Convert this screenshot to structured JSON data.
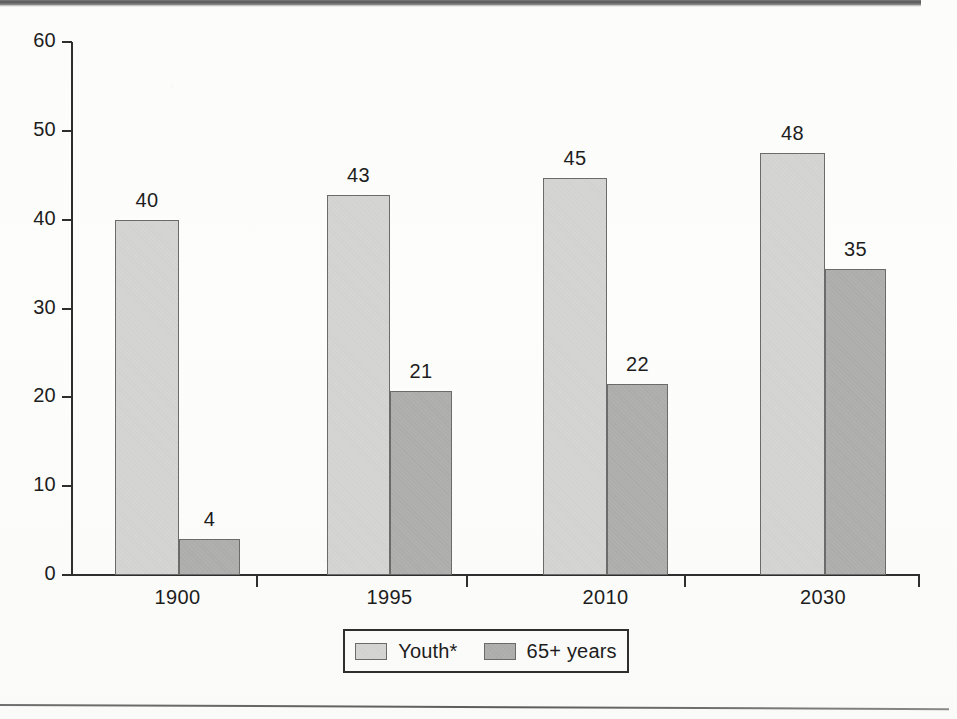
{
  "chart_data": {
    "type": "bar",
    "title": "",
    "xlabel": "",
    "ylabel": "",
    "ylim": [
      0,
      60
    ],
    "ytick_labels": [
      "0",
      "10",
      "20",
      "30",
      "40",
      "50",
      "60"
    ],
    "ytick_values": [
      0,
      10,
      20,
      30,
      40,
      50,
      60
    ],
    "grid": false,
    "legend_position": "bottom-center",
    "categories": [
      "1900",
      "1995",
      "2010",
      "2030"
    ],
    "series": [
      {
        "name": "Youth*",
        "color": "#d5d5d3",
        "values": [
          40,
          43,
          45,
          48
        ],
        "drawn_heights": [
          40.0,
          42.8,
          44.7,
          47.5
        ],
        "labels": [
          "40",
          "43",
          "45",
          "48"
        ]
      },
      {
        "name": "65+ years",
        "color": "#b0b0ae",
        "values": [
          4,
          21,
          22,
          35
        ],
        "drawn_heights": [
          4.0,
          20.7,
          21.5,
          34.4
        ],
        "labels": [
          "4",
          "21",
          "22",
          "35"
        ]
      }
    ],
    "annotations": []
  },
  "legend": {
    "items": [
      {
        "label": "Youth*",
        "swatch": "light-gray-swatch"
      },
      {
        "label": "65+ years",
        "swatch": "dark-gray-swatch"
      }
    ]
  },
  "colors": {
    "youth_fill": "#d5d5d3",
    "senior_fill": "#b0b0ae",
    "bar_border": "#6b6b6b",
    "axis": "#2e2e2e",
    "text": "#1d1d1d",
    "background": "#fdfdfb",
    "top_band": "#585858"
  }
}
